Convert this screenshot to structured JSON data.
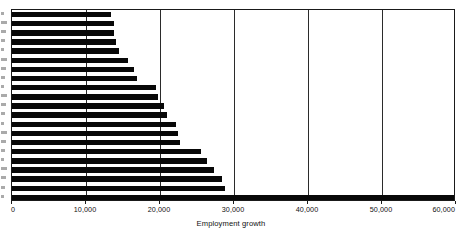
{
  "chart_data": {
    "type": "bar",
    "orientation": "horizontal",
    "title": "",
    "subtitle": "",
    "xlabel": "Employment growth",
    "ylabel": "",
    "xlim": [
      0,
      60000
    ],
    "ylim": null,
    "grid": true,
    "grid_axis": "x",
    "legend": null,
    "legend_position": "none",
    "xticks": [
      0,
      10000,
      20000,
      30000,
      40000,
      50000,
      60000
    ],
    "xticklabels": [
      "0",
      "10,000",
      "20,000",
      "30,000",
      "40,000",
      "50,000",
      "60,000"
    ],
    "yticklabels": [],
    "categories": [
      "",
      "",
      "",
      "",
      "",
      "",
      "",
      "",
      "",
      "",
      "",
      "",
      "",
      "",
      "",
      "",
      "",
      "",
      "",
      "",
      ""
    ],
    "values": [
      13400,
      13800,
      13800,
      14000,
      14500,
      15700,
      16500,
      16900,
      19400,
      19700,
      20500,
      20900,
      22200,
      22400,
      22700,
      25500,
      26300,
      27300,
      28400,
      28800,
      59700
    ],
    "series": [
      {
        "name": "Employment growth",
        "color": "#080808",
        "values": [
          13400,
          13800,
          13800,
          14000,
          14500,
          15700,
          16500,
          16900,
          19400,
          19700,
          20500,
          20900,
          22200,
          22400,
          22700,
          25500,
          26300,
          27300,
          28400,
          28800,
          59700
        ]
      }
    ],
    "bar_count": 21,
    "sorted": "ascending-top-to-bottom",
    "annotations": []
  },
  "axis": {
    "x_title": "Employment growth",
    "ticks": [
      {
        "value": 0,
        "label": "0"
      },
      {
        "value": 10000,
        "label": "10,000"
      },
      {
        "value": 20000,
        "label": "20,000"
      },
      {
        "value": 30000,
        "label": "30,000"
      },
      {
        "value": 40000,
        "label": "40,000"
      },
      {
        "value": 50000,
        "label": "50,000"
      },
      {
        "value": 60000,
        "label": "60,000"
      }
    ]
  },
  "style": {
    "bar_color": "#080808",
    "grid_color": "#2b2b2b",
    "frame_color": "#1a1a1a",
    "background": "#ffffff",
    "text_color": "#111111"
  }
}
